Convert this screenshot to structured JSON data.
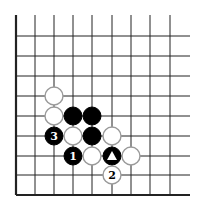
{
  "diagram": {
    "type": "go-board-fragment",
    "grid": {
      "columns_x": [
        16,
        35,
        54,
        73,
        92,
        112,
        131,
        150,
        170
      ],
      "rows_y": [
        36,
        56,
        76,
        96,
        116,
        136,
        156,
        175,
        195
      ],
      "top_y": 15,
      "right_x": 190,
      "left_edge_thick": true,
      "bottom_edge_thick": true,
      "line_color": "#222222"
    },
    "stone_radius": 9,
    "stones": [
      {
        "color": "white",
        "col": 2,
        "row": 3,
        "label": ""
      },
      {
        "color": "white",
        "col": 2,
        "row": 4,
        "label": ""
      },
      {
        "color": "black",
        "col": 3,
        "row": 4,
        "label": ""
      },
      {
        "color": "black",
        "col": 4,
        "row": 4,
        "label": ""
      },
      {
        "color": "black",
        "col": 2,
        "row": 5,
        "label": "3"
      },
      {
        "color": "white",
        "col": 3,
        "row": 5,
        "label": ""
      },
      {
        "color": "black",
        "col": 4,
        "row": 5,
        "label": ""
      },
      {
        "color": "white",
        "col": 5,
        "row": 5,
        "label": ""
      },
      {
        "color": "black",
        "col": 3,
        "row": 6,
        "label": "1"
      },
      {
        "color": "white",
        "col": 4,
        "row": 6,
        "label": ""
      },
      {
        "color": "black",
        "col": 5,
        "row": 6,
        "label": "",
        "marker": "triangle"
      },
      {
        "color": "white",
        "col": 6,
        "row": 6,
        "label": ""
      },
      {
        "color": "white",
        "col": 5,
        "row": 7,
        "label": "2"
      }
    ]
  }
}
